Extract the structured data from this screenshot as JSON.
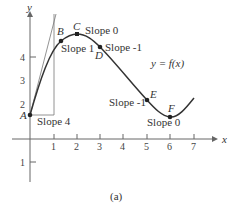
{
  "figure": {
    "caption": "(a)",
    "function_label": "y = f(x)",
    "axis_labels": {
      "x": "x",
      "y": "y"
    },
    "x_ticks": [
      "1",
      "2",
      "3",
      "4",
      "5",
      "6",
      "7"
    ],
    "y_ticks": [
      "4",
      "3",
      "2",
      "1"
    ],
    "points": [
      {
        "name": "A",
        "slope_label": "Slope 4"
      },
      {
        "name": "B",
        "slope_label": "Slope 1"
      },
      {
        "name": "C",
        "slope_label": "Slope 0"
      },
      {
        "name": "D",
        "slope_label": "Slope -1"
      },
      {
        "name": "E",
        "slope_label": "Slope -1"
      },
      {
        "name": "F",
        "slope_label": "Slope 0"
      }
    ],
    "colors": {
      "curve": "#333333",
      "axis": "#555555",
      "text": "#333333"
    }
  }
}
